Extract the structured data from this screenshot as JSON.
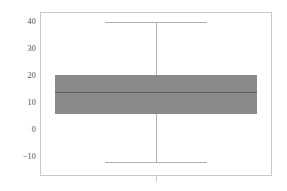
{
  "chart_data": {
    "type": "box",
    "title": "",
    "xlabel": "",
    "ylabel": "",
    "grid": false,
    "legend": null,
    "ylim": [
      -16,
      45
    ],
    "yticks": [
      40,
      30,
      20,
      10,
      0,
      -10
    ],
    "ytick_labels": [
      "40",
      "30",
      "20",
      "10",
      "0",
      "−10"
    ],
    "xticks": [
      1
    ],
    "xtick_labels": [
      ""
    ],
    "categories": [
      "1"
    ],
    "boxes": [
      {
        "name": "series-1",
        "whisker_high": 40,
        "q3": 20.5,
        "median": 14,
        "q1": 6,
        "whisker_low": -12,
        "outliers": [],
        "fill_color": "#8a8a8a",
        "line_color": "#b0b0b0",
        "median_color": "#5f5f5f"
      }
    ]
  },
  "figure": {
    "background": "#ffffff",
    "frame_color": "#c9c9c9",
    "tick_label_color": "#4a4a4a"
  },
  "axis": {
    "y_tick_labels": [
      {
        "text": "40",
        "value": 40
      },
      {
        "text": "30",
        "value": 30
      },
      {
        "text": "20",
        "value": 20
      },
      {
        "text": "10",
        "value": 10
      },
      {
        "text": "0",
        "value": 0
      },
      {
        "text": "−10",
        "value": -10
      }
    ]
  }
}
